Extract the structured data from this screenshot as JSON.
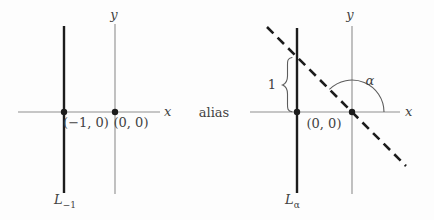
{
  "figure": {
    "alias_label": "alias",
    "left": {
      "x_axis_label": "x",
      "y_axis_label": "y",
      "point_minus1_label": "(−1, 0)",
      "origin_label": "(0, 0)",
      "line_label": "L",
      "line_label_subscript": "−1"
    },
    "right": {
      "x_axis_label": "x",
      "y_axis_label": "y",
      "origin_label": "(0, 0)",
      "angle_label": "α",
      "unit_length_label": "1",
      "line_label": "L",
      "line_label_subscript": "α"
    },
    "colors": {
      "axis": "#8f8f8f",
      "heavy_line": "#1c1c1c",
      "text": "#424242",
      "background": "#fdfdfd"
    }
  }
}
